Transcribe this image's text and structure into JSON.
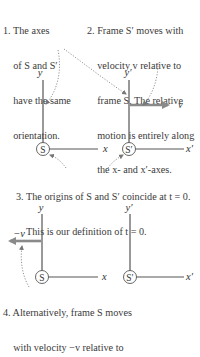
{
  "notes": {
    "n1": {
      "lines": [
        "1. The axes",
        "    of S and S′",
        "    have the same",
        "    orientation."
      ]
    },
    "n2": {
      "lines": [
        "2. Frame S′ moves with",
        "    velocity v relative to",
        "    frame S. The relative",
        "    motion is entirely along",
        "    the x- and x′-axes."
      ]
    },
    "n3": {
      "lines": [
        "3. The origins of S and S′ coincide at t = 0.",
        "    This is our definition of t = 0."
      ]
    },
    "n4": {
      "lines": [
        "4. Alternatively, frame S moves",
        "    with velocity −v relative to"
      ]
    }
  },
  "top_frames": {
    "S": {
      "origin_label": "S",
      "x_label": "x",
      "y_label": "y"
    },
    "S_prime": {
      "origin_label": "S′",
      "x_label": "x′",
      "y_label": "y′",
      "velocity_label": "v"
    }
  },
  "bottom_frames": {
    "S": {
      "origin_label": "S",
      "x_label": "x",
      "y_label": "y",
      "velocity_label": "−v"
    },
    "S_prime": {
      "origin_label": "S′",
      "x_label": "x′",
      "y_label": "y′"
    }
  },
  "colors": {
    "axis": "#555555",
    "arrow": "#8a8a8a",
    "dotted": "#777777",
    "text": "#333333"
  }
}
